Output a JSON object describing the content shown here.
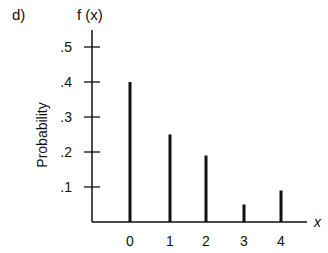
{
  "panel_label": "d)",
  "chart_data": {
    "type": "bar",
    "subtype": "stem",
    "title": "",
    "panel": "d)",
    "xlabel": "x",
    "ylabel": "Probability",
    "y_axis_title": "f (x)",
    "categories": [
      "0",
      "1",
      "2",
      "3",
      "4"
    ],
    "x": [
      0,
      1,
      2,
      3,
      4
    ],
    "values": [
      0.4,
      0.25,
      0.19,
      0.05,
      0.09
    ],
    "yticks": [
      ".1",
      ".2",
      ".3",
      ".4",
      ".5"
    ],
    "ytick_values": [
      0.1,
      0.2,
      0.3,
      0.4,
      0.5
    ],
    "ylim": [
      0,
      0.55
    ],
    "grid": false,
    "legend": null,
    "bar_color": "#111111"
  }
}
